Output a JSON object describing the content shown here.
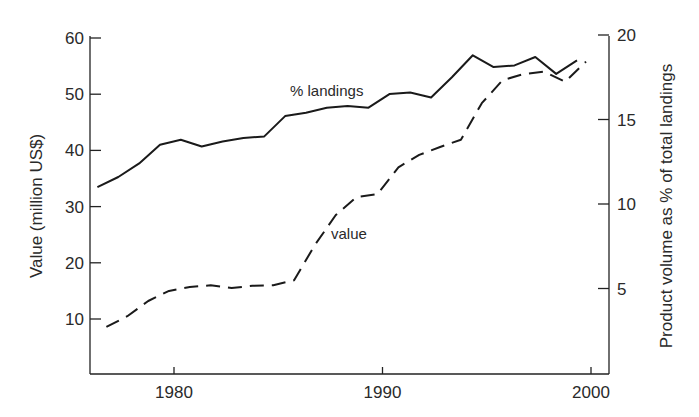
{
  "chart_data": {
    "type": "line",
    "title": "",
    "xlabel": "",
    "ylabel_left": "Value (million US$)",
    "ylabel_right": "Product volume as % of total landings",
    "x_ticks": [
      "1980",
      "1990",
      "2000"
    ],
    "y_left_ticks": [
      "10",
      "20",
      "30",
      "40",
      "50",
      "60"
    ],
    "y_right_ticks": [
      "5",
      "10",
      "15",
      "20"
    ],
    "xlim": [
      1976,
      2001
    ],
    "ylim_left": [
      0,
      60
    ],
    "ylim_right": [
      0,
      20
    ],
    "grid": false,
    "legend": "inline annotations",
    "x": [
      1977,
      1978,
      1979,
      1980,
      1981,
      1982,
      1983,
      1984,
      1985,
      1986,
      1987,
      1988,
      1989,
      1990,
      1991,
      1992,
      1993,
      1994,
      1995,
      1996,
      1997,
      1998,
      1999,
      2000
    ],
    "series": [
      {
        "name": "% landings",
        "axis": "right",
        "style": "solid",
        "values_left_scale": [
          33.0,
          34.7,
          37.2,
          40.6,
          41.3,
          40.1,
          41.0,
          41.7,
          42.0,
          45.6,
          46.3,
          47.0,
          47.3,
          47.1,
          49.6,
          49.9,
          48.8,
          52.6,
          56.4,
          54.3,
          54.5,
          56.1,
          53.0,
          55.6
        ],
        "values": [
          11.0,
          11.6,
          12.4,
          13.5,
          13.8,
          13.4,
          13.7,
          13.9,
          14.0,
          15.2,
          15.4,
          15.7,
          15.8,
          15.7,
          16.5,
          16.6,
          16.3,
          17.5,
          18.8,
          18.1,
          18.2,
          18.7,
          17.7,
          18.5
        ]
      },
      {
        "name": "value",
        "axis": "left",
        "style": "dashed",
        "values": [
          8.6,
          10.5,
          13.2,
          15.0,
          15.7,
          16.0,
          15.5,
          15.9,
          16.0,
          16.9,
          23.2,
          28.5,
          31.7,
          32.2,
          37.0,
          39.2,
          40.6,
          41.9,
          48.4,
          52.5,
          53.6,
          54.0,
          52.2,
          55.8
        ]
      }
    ],
    "annotations": [
      {
        "text": "% landings",
        "near": "solid line"
      },
      {
        "text": "value",
        "near": "dashed line"
      }
    ]
  },
  "labels": {
    "annotation_landings": "% landings",
    "annotation_value": "value",
    "ylabel_left": "Value (million US$)",
    "ylabel_right": "Product volume as % of total landings"
  }
}
